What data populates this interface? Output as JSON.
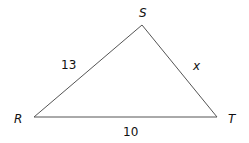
{
  "diagram": {
    "type": "triangle",
    "vertices": [
      {
        "name": "S",
        "label": "S"
      },
      {
        "name": "R",
        "label": "R"
      },
      {
        "name": "T",
        "label": "T"
      }
    ],
    "sides": {
      "RS": "13",
      "ST": "x",
      "RT": "10"
    },
    "line_color": "#555555"
  }
}
